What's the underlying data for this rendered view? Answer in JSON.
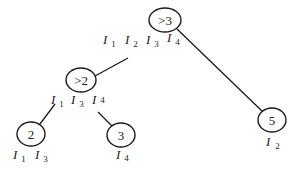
{
  "diagram": {
    "type": "tree",
    "nodes": [
      {
        "id": "root",
        "label": ">3",
        "cx": 165,
        "cy": 20,
        "rx": 16,
        "ry": 12,
        "items": [
          "I1",
          "I2",
          "I3",
          "I4"
        ]
      },
      {
        "id": "n_gt2",
        "label": ">2",
        "cx": 81,
        "cy": 80,
        "rx": 15,
        "ry": 12,
        "items": [
          "I1",
          "I3",
          "I4"
        ]
      },
      {
        "id": "n_2",
        "label": "2",
        "cx": 31,
        "cy": 134,
        "rx": 14,
        "ry": 12,
        "items": [
          "I1",
          "I3"
        ]
      },
      {
        "id": "n_3",
        "label": "3",
        "cx": 121,
        "cy": 135,
        "rx": 14,
        "ry": 12,
        "items": [
          "I4"
        ]
      },
      {
        "id": "n_5",
        "label": "5",
        "cx": 272,
        "cy": 120,
        "rx": 14,
        "ry": 12,
        "items": [
          "I2"
        ]
      }
    ],
    "edges": [
      {
        "from": "root",
        "to": "n_gt2"
      },
      {
        "from": "root",
        "to": "n_5"
      },
      {
        "from": "n_gt2",
        "to": "n_2"
      },
      {
        "from": "n_gt2",
        "to": "n_3"
      }
    ],
    "labels": {
      "root_items": [
        {
          "main": "I",
          "sub": "1"
        },
        {
          "main": "I",
          "sub": "2"
        },
        {
          "main": "I",
          "sub": "3"
        },
        {
          "main": "I",
          "sub": "4"
        }
      ],
      "gt2_items": [
        {
          "main": "I",
          "sub": "1"
        },
        {
          "main": "I",
          "sub": "3"
        },
        {
          "main": "I",
          "sub": "4"
        }
      ],
      "n2_items": [
        {
          "main": "I",
          "sub": "1"
        },
        {
          "main": "I",
          "sub": "3"
        }
      ],
      "n3_items": [
        {
          "main": "I",
          "sub": "4"
        }
      ],
      "n5_items": [
        {
          "main": "I",
          "sub": "2"
        }
      ]
    }
  }
}
